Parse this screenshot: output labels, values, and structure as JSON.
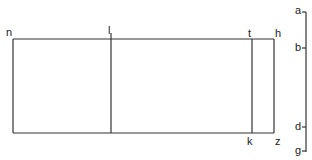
{
  "diagram": {
    "rect_labels": {
      "top_left": "n",
      "top_divider": "l",
      "top_inner_right": "t",
      "top_right": "h",
      "bottom_inner_right": "k",
      "bottom_right": "z"
    },
    "axis_labels": {
      "tick_a": "a",
      "tick_b": "b",
      "tick_d": "d",
      "tick_g": "g"
    },
    "colors": {
      "line": "#333333",
      "text": "#222222",
      "background": "#ffffff"
    }
  }
}
